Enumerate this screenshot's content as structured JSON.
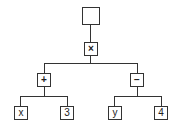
{
  "diagram": {
    "type": "expression-tree",
    "root": {
      "label": ""
    },
    "nodes": {
      "times": {
        "label": "×"
      },
      "plus": {
        "label": "+"
      },
      "minus": {
        "label": "−"
      },
      "x": {
        "label": "x"
      },
      "three": {
        "label": "3"
      },
      "y": {
        "label": "y"
      },
      "four": {
        "label": "4"
      }
    },
    "edges": [
      [
        "root",
        "times"
      ],
      [
        "times",
        "plus"
      ],
      [
        "times",
        "minus"
      ],
      [
        "plus",
        "x"
      ],
      [
        "plus",
        "three"
      ],
      [
        "minus",
        "y"
      ],
      [
        "minus",
        "four"
      ]
    ],
    "colors": {
      "line": "#333333",
      "box_fill": "#ffffff",
      "text": "#222222"
    }
  }
}
